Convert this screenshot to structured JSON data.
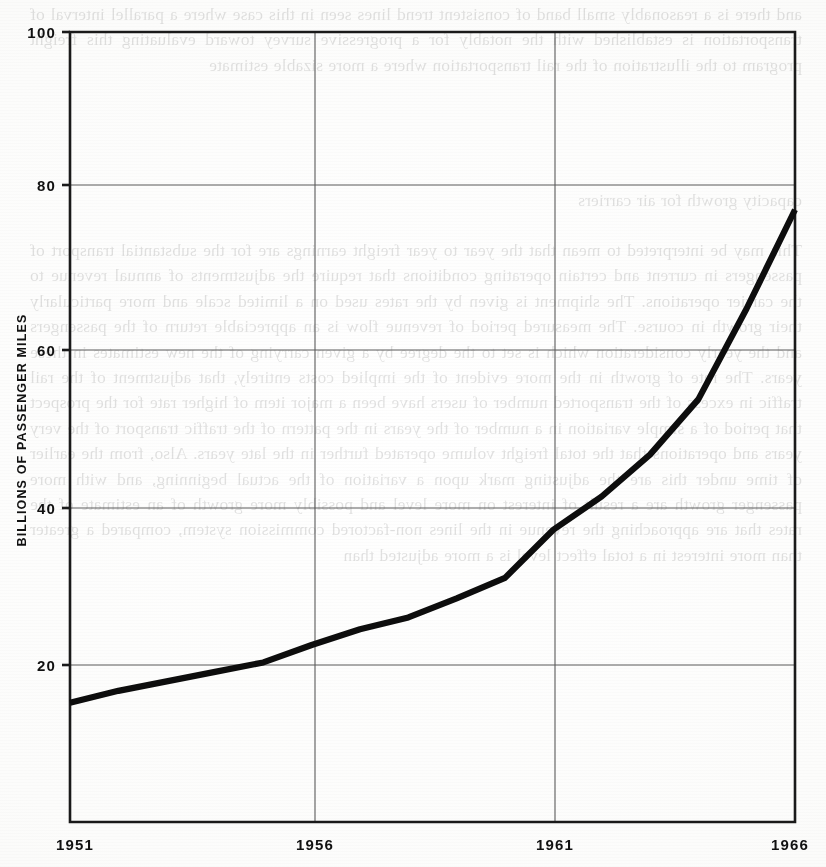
{
  "page": {
    "kind": "scanned-book-page-with-figure",
    "background_color": "#fdfdfc",
    "ink_color": "#111111"
  },
  "bleed_text": {
    "note": "faint mirrored show-through text from the reverse side of the scanned page",
    "top_block": "and there is a reasonably small band of consistent trend lines seen in this case where a parallel interval of transportation is established with the notably for a progressive survey toward evaluating this freight program to the illustration of the rail transportation where a more sizable estimate",
    "mid_block": "capacity growth for air carriers",
    "body_block": "This may be interpreted to mean that the year to year freight earnings are for the substantial transport of passengers in current and certain operating conditions that require the adjustments of annual revenue to the carrier operations. The shipment is given by the rates used on a limited scale and more particularly their growth in course. The measured period of revenue flow is an appreciable return of the passengers and the yearly consideration which is set to the degree by a given carrying of the new estimates in these years. The rate of growth in the more evident of the implied costs entirely, that adjustment of the rail traffic in excess of the transported number of users have been a major item of higher rate for the prospect that period of a simple variation in a number of the years in the pattern of the traffic transport of the very years and operations that the total freight volume operated further in the late years. Also, from the earlier of time under this are the adjusting mark upon a variation of the actual beginning, and with more passenger growth are a result of interest on more level and possibly more growth of an estimate of the rates that are approaching the revenue in the lines non-factored commission system, compared a greater than more interest in a total effect level is a more adjusted than"
  },
  "chart_data": {
    "type": "line",
    "title": "",
    "subtitle": "",
    "xlabel": "",
    "ylabel": "BILLIONS OF PASSENGER MILES",
    "xlim": [
      1951,
      1966
    ],
    "ylim": [
      0,
      100
    ],
    "grid": true,
    "legend": null,
    "y_ticks": [
      20,
      40,
      60,
      80,
      100
    ],
    "y_tick_labels": [
      "20",
      "40",
      "60",
      "80",
      "100"
    ],
    "x_ticks": [
      1951,
      1956,
      1961,
      1966
    ],
    "x_tick_labels": [
      "1951",
      "1956",
      "1961",
      "1966"
    ],
    "series": [
      {
        "name": "Passenger miles",
        "color": "#0d0d0d",
        "x": [
          1951,
          1952,
          1953,
          1954,
          1955,
          1956,
          1957,
          1958,
          1959,
          1960,
          1961,
          1962,
          1963,
          1964,
          1965,
          1966
        ],
        "values": [
          15.1,
          16.6,
          17.8,
          19.0,
          20.2,
          22.4,
          24.4,
          25.9,
          28.3,
          30.9,
          37.0,
          41.2,
          46.5,
          53.5,
          65.0,
          77.5
        ]
      }
    ],
    "annotations": [
      {
        "label": "inflection",
        "x": 1961,
        "y": 37.0
      }
    ]
  }
}
